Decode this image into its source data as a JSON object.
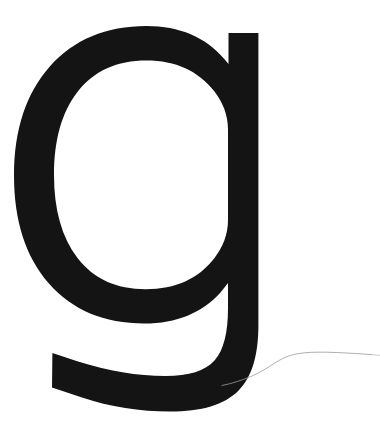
{
  "page": {
    "kind": "type-specimen",
    "background_color": "#ffffff",
    "width": 380,
    "height": 441
  },
  "glyph": {
    "character": "g",
    "name": "latin-small-letter-g",
    "case": "lowercase",
    "style": "single-storey-sans-serif",
    "ink_color": "#141414",
    "bounds": {
      "left": 22,
      "top": 29,
      "right": 259,
      "bottom": 410
    },
    "parts": [
      {
        "name": "bowl",
        "description": "closed round bowl with open counter"
      },
      {
        "name": "stem",
        "description": "vertical stem on right side with flat top"
      },
      {
        "name": "descender-tail",
        "description": "descender curving left to a slanted terminal"
      },
      {
        "name": "counter",
        "description": "white enclosed space inside bowl"
      }
    ]
  },
  "artifact": {
    "name": "hairline-curve",
    "description": "thin stray hair or thread across lower right",
    "color": "#9a9aa0",
    "stroke_width": 0.8
  }
}
